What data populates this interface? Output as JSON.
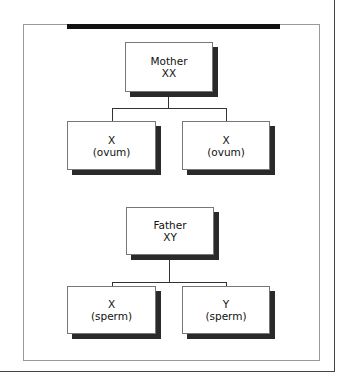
{
  "diagram": {
    "type": "tree",
    "title": "",
    "trees": [
      {
        "parent": {
          "label": "Mother",
          "genotype": "XX"
        },
        "children": [
          {
            "label": "X",
            "sub": "(ovum)"
          },
          {
            "label": "X",
            "sub": "(ovum)"
          }
        ]
      },
      {
        "parent": {
          "label": "Father",
          "genotype": "XY"
        },
        "children": [
          {
            "label": "X",
            "sub": "(sperm)"
          },
          {
            "label": "Y",
            "sub": "(sperm)"
          }
        ]
      }
    ]
  }
}
